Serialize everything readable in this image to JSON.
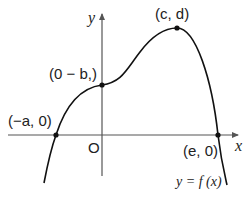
{
  "diagram": {
    "type": "function-graph",
    "axes": {
      "x_label": "x",
      "y_label": "y",
      "origin_label": "O"
    },
    "points": [
      {
        "id": "left-root",
        "label": "(−a, 0)",
        "px": [
          56,
          135
        ]
      },
      {
        "id": "y-intercept",
        "label": "(0 − b,)",
        "px": [
          102,
          85
        ]
      },
      {
        "id": "maximum",
        "label": "(c, d)",
        "px": [
          177,
          28
        ]
      },
      {
        "id": "right-root",
        "label": "(e, 0)",
        "px": [
          218,
          135
        ]
      }
    ],
    "curve_label": "y = f (x)",
    "colors": {
      "curve": "#111111",
      "axes": "#555555",
      "background": "#ffffff"
    }
  }
}
